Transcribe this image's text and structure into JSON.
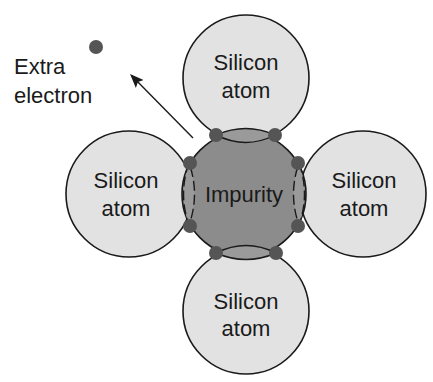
{
  "diagram": {
    "colors": {
      "silicon_fill": "#e2e2e2",
      "impurity_fill": "#8c8c8c",
      "bond_dot": "#555555",
      "outline": "#1a1a1a",
      "electron": "#555555"
    },
    "center": {
      "label": "Impurity"
    },
    "atoms": [
      {
        "position": "top",
        "line1": "Silicon",
        "line2": "atom"
      },
      {
        "position": "left",
        "line1": "Silicon",
        "line2": "atom"
      },
      {
        "position": "right",
        "line1": "Silicon",
        "line2": "atom"
      },
      {
        "position": "bottom",
        "line1": "Silicon",
        "line2": "atom"
      }
    ],
    "extra_electron": {
      "line1": "Extra",
      "line2": "electron"
    }
  }
}
